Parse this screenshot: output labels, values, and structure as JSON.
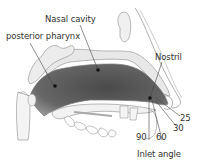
{
  "diagram": {
    "labels": {
      "nasal_cavity": "Nasal cavity",
      "posterior_pharynx": "posterior pharynx",
      "nostril": "Nostril",
      "inlet_angle": "Inlet angle"
    },
    "angles": [
      "25",
      "30",
      "60",
      "90"
    ],
    "colors": {
      "cavity_fill": "#5a5a5a",
      "tissue_fill": "#e6e6e6",
      "outline": "#888888",
      "text": "#333333",
      "points": "#111111"
    }
  }
}
